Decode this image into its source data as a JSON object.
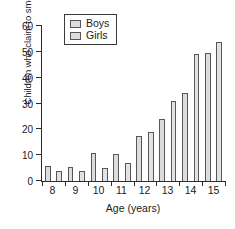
{
  "chart_data": {
    "type": "bar",
    "title": "",
    "xlabel": "Age (years)",
    "ylabel": "Children who claim to smoke cigarettes (%)",
    "categories": [
      "8",
      "9",
      "10",
      "11",
      "12",
      "13",
      "14",
      "15"
    ],
    "series": [
      {
        "name": "Boys",
        "values": [
          6,
          5.5,
          11,
          10.5,
          17.5,
          24,
          34,
          49.5
        ]
      },
      {
        "name": "Girls",
        "values": [
          4,
          4,
          5,
          7,
          19,
          31,
          49,
          54
        ]
      }
    ],
    "ylim": [
      0,
      60
    ],
    "yticks": [
      0,
      10,
      20,
      30,
      40,
      50,
      60
    ],
    "ytick_labels": [
      "0",
      "10",
      "20",
      "30",
      "40",
      "50",
      "60"
    ],
    "grid": false,
    "legend": {
      "position": "top-left",
      "entries": [
        "Boys",
        "Girls"
      ]
    },
    "colors": {
      "boys": "#dcdcdc",
      "girls": "#e2e2e2",
      "edge": "#575757",
      "axis": "#2b2b2b"
    }
  }
}
